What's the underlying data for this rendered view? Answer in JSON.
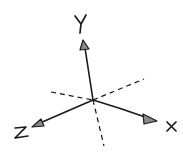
{
  "diagram": {
    "colors": {
      "stroke": "#1a1a1a",
      "arrow_fill": "#8a8a8a",
      "background": "#ffffff"
    },
    "origin": [
      93,
      100
    ],
    "axes": [
      {
        "name": "Y",
        "label": "Y",
        "direction": "up",
        "end": [
          84,
          41
        ]
      },
      {
        "name": "X",
        "label": "X",
        "direction": "right-down",
        "end": [
          157,
          120
        ]
      },
      {
        "name": "Z",
        "label": "Z",
        "direction": "left-down",
        "end": [
          32,
          126
        ]
      }
    ],
    "hidden_axes": [
      {
        "name": "negative-x",
        "style": "dashed",
        "from": [
          51,
          92
        ],
        "to": [
          93,
          100
        ]
      },
      {
        "name": "negative-z",
        "style": "dashed",
        "from": [
          93,
          100
        ],
        "to": [
          144,
          79
        ]
      },
      {
        "name": "negative-y",
        "style": "dashed",
        "from": [
          93,
          100
        ],
        "to": [
          104,
          146
        ]
      }
    ]
  }
}
